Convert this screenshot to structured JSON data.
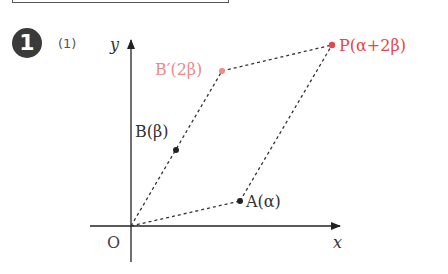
{
  "problem": {
    "number": "1",
    "part": "(1)"
  },
  "diagram": {
    "axes": {
      "x_label": "x",
      "y_label": "y",
      "origin_label": "O"
    },
    "points": [
      {
        "id": "A",
        "label": "A(α)",
        "color": "#333333"
      },
      {
        "id": "B",
        "label": "B(β)",
        "color": "#333333"
      },
      {
        "id": "Bp",
        "label": "B′(2β)",
        "color": "#f08a8a"
      },
      {
        "id": "P",
        "label": "P(α+2β)",
        "color": "#e8454a"
      }
    ],
    "segments": [
      "O–A",
      "O–B′",
      "B′–P",
      "A–P"
    ],
    "style": {
      "dash_color": "#333333",
      "accent_pink": "#f08a8a",
      "accent_red": "#e8454a"
    }
  }
}
